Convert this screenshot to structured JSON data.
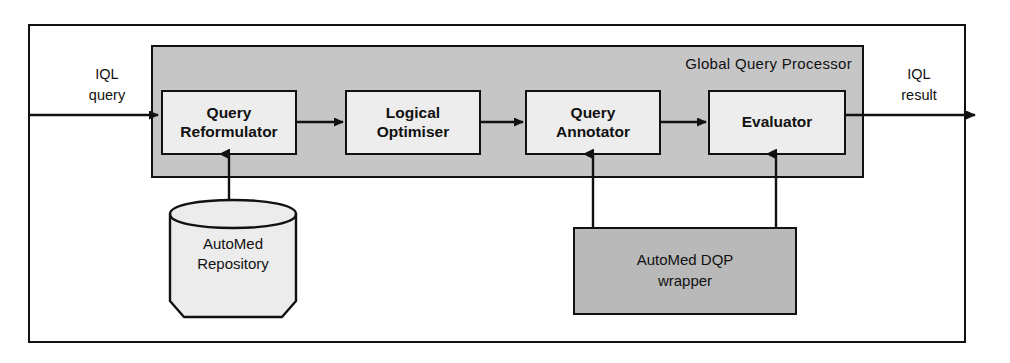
{
  "diagram": {
    "outer_frame": {
      "name": "system-boundary"
    },
    "panel": {
      "label": "Global Query Processor",
      "fill_color": "#c6c6c6",
      "border_color": "#111111"
    },
    "stages": [
      {
        "id": "reformulator",
        "line1": "Query",
        "line2": "Reformulator",
        "fill_color": "#ededed"
      },
      {
        "id": "optimiser",
        "line1": "Logical",
        "line2": "Optimiser",
        "fill_color": "#ededed"
      },
      {
        "id": "annotator",
        "line1": "Query",
        "line2": "Annotator",
        "fill_color": "#ededed"
      },
      {
        "id": "evaluator",
        "line1": "Evaluator",
        "line2": "",
        "fill_color": "#ededed"
      }
    ],
    "repository": {
      "line1": "AutoMed",
      "line2": "Repository",
      "fill_color": "#ececec",
      "shape": "cylinder"
    },
    "wrapper": {
      "line1": "AutoMed DQP",
      "line2": "wrapper",
      "fill_color": "#b9b9b9"
    },
    "ports": {
      "input": {
        "line1": "IQL",
        "line2": "query"
      },
      "output": {
        "line1": "IQL",
        "line2": "result"
      }
    },
    "edges": [
      {
        "id": "input-to-reformulator",
        "from": "IQL query",
        "to": "Query Reformulator",
        "direction": "right"
      },
      {
        "id": "reformulator-to-optimiser",
        "from": "Query Reformulator",
        "to": "Logical Optimiser",
        "direction": "right"
      },
      {
        "id": "optimiser-to-annotator",
        "from": "Logical Optimiser",
        "to": "Query Annotator",
        "direction": "right"
      },
      {
        "id": "annotator-to-evaluator",
        "from": "Query Annotator",
        "to": "Evaluator",
        "direction": "right"
      },
      {
        "id": "evaluator-to-output",
        "from": "Evaluator",
        "to": "IQL result",
        "direction": "right"
      },
      {
        "id": "repository-to-reformulator",
        "from": "AutoMed Repository",
        "to": "Query Reformulator",
        "direction": "up"
      },
      {
        "id": "wrapper-to-annotator",
        "from": "AutoMed DQP wrapper",
        "to": "Query Annotator",
        "direction": "up"
      },
      {
        "id": "wrapper-to-evaluator",
        "from": "AutoMed DQP wrapper",
        "to": "Evaluator",
        "direction": "up"
      }
    ]
  }
}
